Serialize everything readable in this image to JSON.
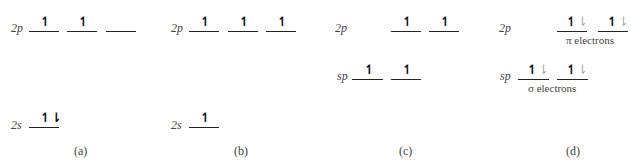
{
  "panels": [
    {
      "caption": "(a)",
      "levels": [
        {
          "label": "2p",
          "orbitals": [
            "↿",
            "↿",
            ""
          ]
        },
        {
          "label": "2s",
          "orbitals": [
            "↿⇂"
          ]
        }
      ]
    },
    {
      "caption": "(b)",
      "levels": [
        {
          "label": "2p",
          "orbitals": [
            "↿",
            "↿",
            "↿"
          ]
        },
        {
          "label": "2s",
          "orbitals": [
            "↿"
          ]
        }
      ]
    },
    {
      "caption": "(c)",
      "levels": [
        {
          "label": "2p",
          "orbitals": [
            "↿",
            "↿"
          ]
        },
        {
          "label": "sp",
          "orbitals": [
            "↿",
            "↿"
          ]
        }
      ]
    },
    {
      "caption": "(d)",
      "levels": [
        {
          "label": "2p",
          "orbitals": [
            "↿⇂",
            "↿⇂"
          ],
          "note": "π electrons"
        },
        {
          "label": "sp",
          "orbitals": [
            "↿⇂",
            "↿⇂"
          ],
          "note": "σ electrons"
        }
      ]
    }
  ],
  "glyphs": {
    "up": "↿",
    "down": "⇂"
  },
  "colors": {
    "line": "#222222",
    "text": "#444444",
    "added_electron": "#aaaaaa"
  }
}
